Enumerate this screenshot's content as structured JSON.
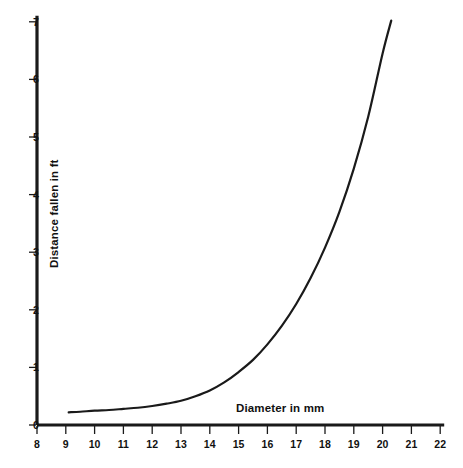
{
  "chart_data": {
    "type": "line",
    "title": "",
    "subtitle": "",
    "xlabel": "Diameter in mm",
    "ylabel": "Distance fallen in ft",
    "xlim": [
      8,
      22
    ],
    "ylim": [
      0,
      7
    ],
    "xticks": [
      8,
      9,
      10,
      11,
      12,
      13,
      14,
      15,
      16,
      17,
      18,
      19,
      20,
      21,
      22
    ],
    "yticks": [
      0,
      1,
      2,
      3,
      4,
      5,
      6,
      7
    ],
    "xtick_labels": [
      "8",
      "9",
      "10",
      "11",
      "12",
      "13",
      "14",
      "15",
      "16",
      "17",
      "18",
      "19",
      "20",
      "21",
      "22"
    ],
    "ytick_labels": [
      "0",
      "1",
      "2",
      "3",
      "4",
      "5",
      "6",
      "7"
    ],
    "grid": false,
    "legend": null,
    "legend_position": "none",
    "annotations": [],
    "line_color": "#1a1a1a",
    "line_width": 2.2,
    "axis_color": "#1a1a1a",
    "background_color": "#ffffff",
    "series": [
      {
        "name": "distance-fallen-vs-diameter",
        "x": [
          9.1,
          9.5,
          10.0,
          10.5,
          11.0,
          11.5,
          12.0,
          12.5,
          13.0,
          13.5,
          14.0,
          14.5,
          15.0,
          15.5,
          16.0,
          16.5,
          17.0,
          17.5,
          18.0,
          18.5,
          19.0,
          19.5,
          20.0,
          20.3
        ],
        "y": [
          0.22,
          0.23,
          0.25,
          0.26,
          0.28,
          0.3,
          0.33,
          0.37,
          0.42,
          0.5,
          0.6,
          0.74,
          0.92,
          1.13,
          1.4,
          1.72,
          2.1,
          2.55,
          3.08,
          3.7,
          4.45,
          5.35,
          6.45,
          7.02
        ]
      }
    ]
  },
  "axes": {
    "x_tick_positions_px": [
      37,
      65.8,
      94.6,
      123.4,
      152.2,
      181,
      209.8,
      238.6,
      267.4,
      296.2,
      325,
      353.8,
      382.6,
      411.4,
      440.2
    ],
    "y_tick_positions_px": [
      425,
      367.4,
      309.8,
      252.2,
      194.6,
      137,
      79.4,
      21.8
    ]
  }
}
